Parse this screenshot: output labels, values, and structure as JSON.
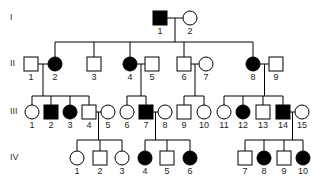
{
  "generations": [
    {
      "label": "I",
      "y": 18
    },
    {
      "label": "II",
      "y": 64
    },
    {
      "label": "III",
      "y": 112
    },
    {
      "label": "IV",
      "y": 158
    }
  ],
  "individuals": [
    {
      "gen": "I",
      "num": "1",
      "sex": "male",
      "affected": true,
      "x": 160
    },
    {
      "gen": "I",
      "num": "2",
      "sex": "female",
      "affected": false,
      "x": 190
    },
    {
      "gen": "II",
      "num": "1",
      "sex": "male",
      "affected": false,
      "x": 31
    },
    {
      "gen": "II",
      "num": "2",
      "sex": "female",
      "affected": true,
      "x": 55
    },
    {
      "gen": "II",
      "num": "3",
      "sex": "male",
      "affected": false,
      "x": 94
    },
    {
      "gen": "II",
      "num": "4",
      "sex": "female",
      "affected": true,
      "x": 130
    },
    {
      "gen": "II",
      "num": "5",
      "sex": "male",
      "affected": false,
      "x": 152
    },
    {
      "gen": "II",
      "num": "6",
      "sex": "male",
      "affected": false,
      "x": 184
    },
    {
      "gen": "II",
      "num": "7",
      "sex": "female",
      "affected": false,
      "x": 206
    },
    {
      "gen": "II",
      "num": "8",
      "sex": "female",
      "affected": true,
      "x": 253
    },
    {
      "gen": "II",
      "num": "9",
      "sex": "male",
      "affected": false,
      "x": 276
    },
    {
      "gen": "III",
      "num": "1",
      "sex": "female",
      "affected": false,
      "x": 32
    },
    {
      "gen": "III",
      "num": "2",
      "sex": "male",
      "affected": true,
      "x": 51
    },
    {
      "gen": "III",
      "num": "3",
      "sex": "female",
      "affected": true,
      "x": 70
    },
    {
      "gen": "III",
      "num": "4",
      "sex": "male",
      "affected": false,
      "x": 89
    },
    {
      "gen": "III",
      "num": "5",
      "sex": "female",
      "affected": false,
      "x": 108
    },
    {
      "gen": "III",
      "num": "6",
      "sex": "female",
      "affected": false,
      "x": 127
    },
    {
      "gen": "III",
      "num": "7",
      "sex": "male",
      "affected": true,
      "x": 146
    },
    {
      "gen": "III",
      "num": "8",
      "sex": "female",
      "affected": false,
      "x": 165
    },
    {
      "gen": "III",
      "num": "9",
      "sex": "male",
      "affected": false,
      "x": 184
    },
    {
      "gen": "III",
      "num": "10",
      "sex": "female",
      "affected": false,
      "x": 204
    },
    {
      "gen": "III",
      "num": "11",
      "sex": "female",
      "affected": false,
      "x": 224
    },
    {
      "gen": "III",
      "num": "12",
      "sex": "female",
      "affected": true,
      "x": 243
    },
    {
      "gen": "III",
      "num": "13",
      "sex": "male",
      "affected": false,
      "x": 263
    },
    {
      "gen": "III",
      "num": "14",
      "sex": "male",
      "affected": true,
      "x": 283
    },
    {
      "gen": "III",
      "num": "15",
      "sex": "female",
      "affected": false,
      "x": 302
    },
    {
      "gen": "IV",
      "num": "1",
      "sex": "female",
      "affected": false,
      "x": 77
    },
    {
      "gen": "IV",
      "num": "2",
      "sex": "male",
      "affected": false,
      "x": 100
    },
    {
      "gen": "IV",
      "num": "3",
      "sex": "female",
      "affected": false,
      "x": 122
    },
    {
      "gen": "IV",
      "num": "4",
      "sex": "female",
      "affected": true,
      "x": 145
    },
    {
      "gen": "IV",
      "num": "5",
      "sex": "male",
      "affected": false,
      "x": 167
    },
    {
      "gen": "IV",
      "num": "6",
      "sex": "female",
      "affected": true,
      "x": 190
    },
    {
      "gen": "IV",
      "num": "7",
      "sex": "male",
      "affected": false,
      "x": 245
    },
    {
      "gen": "IV",
      "num": "8",
      "sex": "female",
      "affected": true,
      "x": 264
    },
    {
      "gen": "IV",
      "num": "9",
      "sex": "male",
      "affected": false,
      "x": 284
    },
    {
      "gen": "IV",
      "num": "10",
      "sex": "female",
      "affected": true,
      "x": 303
    }
  ],
  "legend": {
    "affected_color": "#000000",
    "unaffected_color": "#ffffff",
    "line_color": "#000000"
  }
}
